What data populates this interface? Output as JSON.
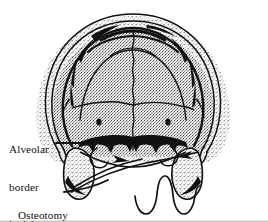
{
  "figure": {
    "type": "anatomical-line-illustration",
    "background_color": "#ffffff",
    "ink_color": "#101010",
    "width": 268,
    "height": 222
  },
  "labels": {
    "alveolar": {
      "text": "Alveolar border incision",
      "lines": [
        "Alveolar",
        "border",
        "incision"
      ]
    },
    "osteotomy": {
      "text": "Osteotomy",
      "lines": [
        "Osteotomy"
      ]
    }
  },
  "annotations": {
    "leader_alveolar": "leader-line-alveolar",
    "leader_osteotomy": "leader-line-osteotomy",
    "arrowhead_left": "arrowhead-left",
    "arrowhead_right": "arrowhead-right"
  },
  "anatomy": {
    "outer_contour": "maxilla-outer-contour",
    "inner_dome": "maxilla-inner-dome",
    "midline_suture": "midline-suture",
    "transverse_suture": "transverse-suture",
    "palatine_arc": "palatine-arc",
    "alveolar_band": "alveolar-border-band",
    "foramen_left": "incisive-foramen-left",
    "foramen_right": "incisive-foramen-right",
    "tuberosity_left": "maxillary-tuberosity-left",
    "tuberosity_right": "maxillary-tuberosity-right",
    "tooth_scallop": "tooth-scallop-outline",
    "osteotomy_cut": "osteotomy-cut-line"
  }
}
